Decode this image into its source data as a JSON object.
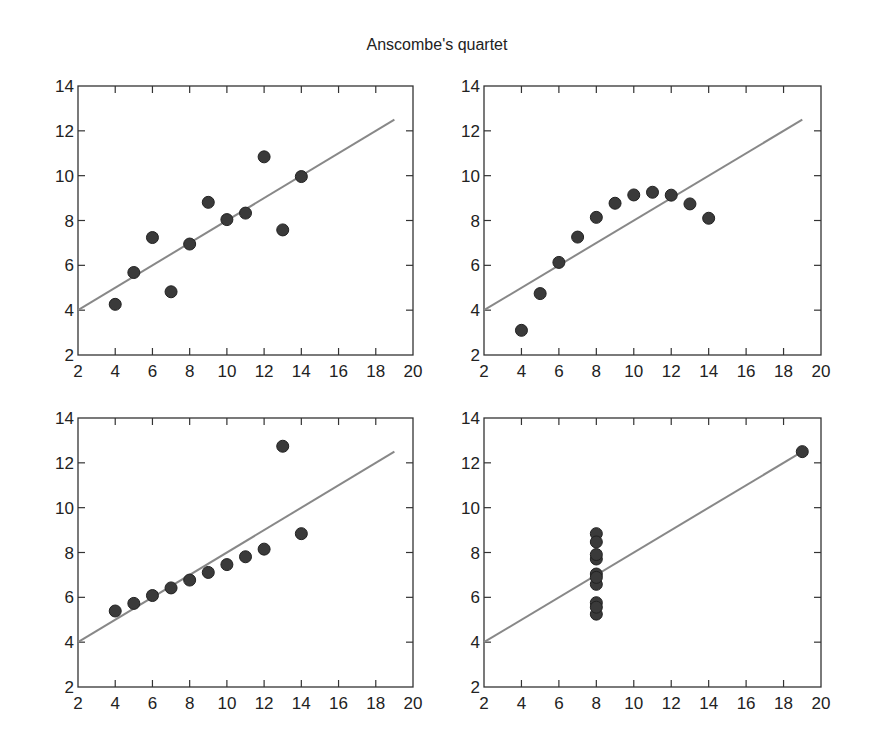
{
  "title": "Anscombe's quartet",
  "chart_data": [
    {
      "type": "scatter",
      "panel": "I",
      "position": "top-left",
      "x": [
        10,
        8,
        13,
        9,
        11,
        14,
        6,
        4,
        12,
        7,
        5
      ],
      "y": [
        8.04,
        6.95,
        7.58,
        8.81,
        8.33,
        9.96,
        7.24,
        4.26,
        10.84,
        4.82,
        5.68
      ],
      "fit_line": {
        "slope": 0.5,
        "intercept": 3,
        "x_range": [
          2,
          19
        ]
      },
      "xlim": [
        2,
        20
      ],
      "ylim": [
        2,
        14
      ],
      "xticks": [
        2,
        4,
        6,
        8,
        10,
        12,
        14,
        16,
        18,
        20
      ],
      "yticks": [
        2,
        4,
        6,
        8,
        10,
        12,
        14
      ],
      "xlabel": "",
      "ylabel": "",
      "grid": false
    },
    {
      "type": "scatter",
      "panel": "II",
      "position": "top-right",
      "x": [
        10,
        8,
        13,
        9,
        11,
        14,
        6,
        4,
        12,
        7,
        5
      ],
      "y": [
        9.14,
        8.14,
        8.74,
        8.77,
        9.26,
        8.1,
        6.13,
        3.1,
        9.13,
        7.26,
        4.74
      ],
      "fit_line": {
        "slope": 0.5,
        "intercept": 3,
        "x_range": [
          2,
          19
        ]
      },
      "xlim": [
        2,
        20
      ],
      "ylim": [
        2,
        14
      ],
      "xticks": [
        2,
        4,
        6,
        8,
        10,
        12,
        14,
        16,
        18,
        20
      ],
      "yticks": [
        2,
        4,
        6,
        8,
        10,
        12,
        14
      ],
      "xlabel": "",
      "ylabel": "",
      "grid": false
    },
    {
      "type": "scatter",
      "panel": "III",
      "position": "bottom-left",
      "x": [
        10,
        8,
        13,
        9,
        11,
        14,
        6,
        4,
        12,
        7,
        5
      ],
      "y": [
        7.46,
        6.77,
        12.74,
        7.11,
        7.81,
        8.84,
        6.08,
        5.39,
        8.15,
        6.42,
        5.73
      ],
      "fit_line": {
        "slope": 0.5,
        "intercept": 3,
        "x_range": [
          2,
          19
        ]
      },
      "xlim": [
        2,
        20
      ],
      "ylim": [
        2,
        14
      ],
      "xticks": [
        2,
        4,
        6,
        8,
        10,
        12,
        14,
        16,
        18,
        20
      ],
      "yticks": [
        2,
        4,
        6,
        8,
        10,
        12,
        14
      ],
      "xlabel": "",
      "ylabel": "",
      "grid": false
    },
    {
      "type": "scatter",
      "panel": "IV",
      "position": "bottom-right",
      "x": [
        8,
        8,
        8,
        8,
        8,
        8,
        8,
        19,
        8,
        8,
        8
      ],
      "y": [
        6.58,
        5.76,
        7.71,
        8.84,
        8.47,
        7.04,
        5.25,
        12.5,
        5.56,
        7.91,
        6.89
      ],
      "fit_line": {
        "slope": 0.5,
        "intercept": 3,
        "x_range": [
          2,
          19
        ]
      },
      "xlim": [
        2,
        20
      ],
      "ylim": [
        2,
        14
      ],
      "xticks": [
        2,
        4,
        6,
        8,
        10,
        12,
        14,
        16,
        18,
        20
      ],
      "yticks": [
        2,
        4,
        6,
        8,
        10,
        12,
        14
      ],
      "xlabel": "",
      "ylabel": "",
      "grid": false
    }
  ]
}
